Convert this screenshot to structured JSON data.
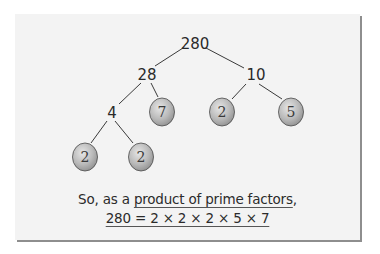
{
  "diagram": {
    "type": "factor-tree",
    "root": "280",
    "nodes": [
      {
        "id": "n280",
        "label": "280",
        "prime": false,
        "x": 195,
        "y": 44
      },
      {
        "id": "n28",
        "label": "28",
        "prime": false,
        "x": 147,
        "y": 75
      },
      {
        "id": "n10",
        "label": "10",
        "prime": false,
        "x": 256,
        "y": 75
      },
      {
        "id": "n4",
        "label": "4",
        "prime": false,
        "x": 112,
        "y": 113
      },
      {
        "id": "n7",
        "label": "7",
        "prime": true,
        "x": 162,
        "y": 112
      },
      {
        "id": "n2a",
        "label": "2",
        "prime": true,
        "x": 222,
        "y": 112
      },
      {
        "id": "n5",
        "label": "5",
        "prime": true,
        "x": 291,
        "y": 112
      },
      {
        "id": "n2b",
        "label": "2",
        "prime": true,
        "x": 85,
        "y": 157
      },
      {
        "id": "n2c",
        "label": "2",
        "prime": true,
        "x": 141,
        "y": 157
      }
    ],
    "edges": [
      [
        "n280",
        "n28"
      ],
      [
        "n280",
        "n10"
      ],
      [
        "n28",
        "n4"
      ],
      [
        "n28",
        "n7"
      ],
      [
        "n10",
        "n2a"
      ],
      [
        "n10",
        "n5"
      ],
      [
        "n4",
        "n2b"
      ],
      [
        "n4",
        "n2c"
      ]
    ],
    "prime_fill": "#b8b8b8",
    "card_bg": "#f3f3f3",
    "shadow": "#8e8e8e"
  },
  "caption": {
    "prefix": "So, as a ",
    "underlined": "product of prime factors",
    "suffix": ",",
    "equation": "280 = 2 × 2 × 2 × 5 × 7"
  }
}
